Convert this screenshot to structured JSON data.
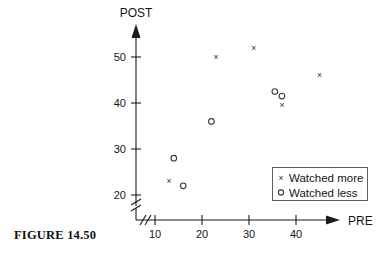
{
  "figure": {
    "caption": "FIGURE 14.50"
  },
  "axes": {
    "y_title": "POST",
    "x_title": "PRE",
    "y_ticks": [
      "20",
      "30",
      "40",
      "50"
    ],
    "x_ticks": [
      "10",
      "20",
      "30",
      "40"
    ],
    "break_symbol": "//"
  },
  "legend": {
    "items": [
      {
        "marker": "x",
        "label": "Watched more"
      },
      {
        "marker": "o",
        "label": "Watched less"
      }
    ]
  },
  "chart_data": {
    "type": "scatter",
    "title": "",
    "xlabel": "PRE",
    "ylabel": "POST",
    "xlim": [
      8,
      48
    ],
    "ylim": [
      18,
      55
    ],
    "xticks": [
      10,
      20,
      30,
      40
    ],
    "yticks": [
      20,
      30,
      40,
      50
    ],
    "grid": false,
    "legend_position": "bottom-right",
    "axis_break_x": true,
    "axis_break_y": true,
    "series": [
      {
        "name": "Watched more",
        "marker": "x",
        "points": [
          {
            "x": 13,
            "y": 23
          },
          {
            "x": 23,
            "y": 50
          },
          {
            "x": 31,
            "y": 52
          },
          {
            "x": 37,
            "y": 39.5
          },
          {
            "x": 45,
            "y": 46
          }
        ]
      },
      {
        "name": "Watched less",
        "marker": "o",
        "points": [
          {
            "x": 14,
            "y": 28
          },
          {
            "x": 16,
            "y": 22
          },
          {
            "x": 22,
            "y": 36
          },
          {
            "x": 35.5,
            "y": 42.5
          },
          {
            "x": 37,
            "y": 41.5
          }
        ]
      }
    ]
  }
}
